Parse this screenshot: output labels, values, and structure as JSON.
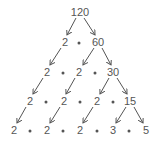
{
  "diagram": {
    "type": "factor-tree",
    "root": "120",
    "rows": [
      {
        "y": 12,
        "items": [
          {
            "t": "num",
            "v": "120",
            "x": 80
          }
        ]
      },
      {
        "y": 42,
        "items": [
          {
            "t": "num",
            "v": "2",
            "x": 65
          },
          {
            "t": "dot",
            "x": 79
          },
          {
            "t": "num",
            "v": "60",
            "x": 98
          }
        ]
      },
      {
        "y": 72,
        "items": [
          {
            "t": "num",
            "v": "2",
            "x": 47
          },
          {
            "t": "dot",
            "x": 63
          },
          {
            "t": "num",
            "v": "2",
            "x": 79
          },
          {
            "t": "dot",
            "x": 95
          },
          {
            "t": "num",
            "v": "30",
            "x": 113
          }
        ]
      },
      {
        "y": 101,
        "items": [
          {
            "t": "num",
            "v": "2",
            "x": 30
          },
          {
            "t": "dot",
            "x": 46
          },
          {
            "t": "num",
            "v": "2",
            "x": 64
          },
          {
            "t": "dot",
            "x": 80
          },
          {
            "t": "num",
            "v": "2",
            "x": 97
          },
          {
            "t": "dot",
            "x": 113
          },
          {
            "t": "num",
            "v": "15",
            "x": 130
          }
        ]
      },
      {
        "y": 130,
        "items": [
          {
            "t": "num",
            "v": "2",
            "x": 14
          },
          {
            "t": "dot",
            "x": 30
          },
          {
            "t": "num",
            "v": "2",
            "x": 47
          },
          {
            "t": "dot",
            "x": 63
          },
          {
            "t": "num",
            "v": "2",
            "x": 80
          },
          {
            "t": "dot",
            "x": 97
          },
          {
            "t": "num",
            "v": "3",
            "x": 113
          },
          {
            "t": "dot",
            "x": 129
          },
          {
            "t": "num",
            "v": "5",
            "x": 146
          }
        ]
      }
    ],
    "arrows": [
      [
        76,
        18,
        67,
        35
      ],
      [
        84,
        18,
        95,
        35
      ],
      [
        61,
        48,
        50,
        65
      ],
      [
        94,
        48,
        83,
        65
      ],
      [
        102,
        48,
        111,
        65
      ],
      [
        43,
        78,
        33,
        94
      ],
      [
        75,
        78,
        66,
        94
      ],
      [
        109,
        78,
        100,
        94
      ],
      [
        117,
        78,
        127,
        94
      ],
      [
        26,
        107,
        17,
        123
      ],
      [
        60,
        107,
        50,
        123
      ],
      [
        93,
        107,
        83,
        123
      ],
      [
        126,
        107,
        116,
        123
      ],
      [
        134,
        107,
        143,
        123
      ]
    ],
    "final_factorization": "2 • 2 • 2 • 3 • 5",
    "color": "#555555"
  }
}
